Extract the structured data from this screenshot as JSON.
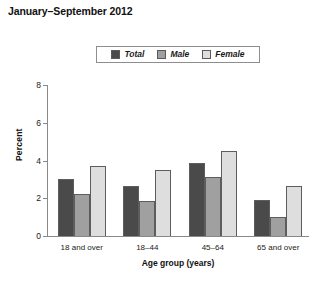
{
  "title": "January–September 2012",
  "legend": {
    "position": "top-center",
    "entries": [
      {
        "label": "Total",
        "color": "#4a4a4a"
      },
      {
        "label": "Male",
        "color": "#a0a0a0"
      },
      {
        "label": "Female",
        "color": "#dedede"
      }
    ]
  },
  "chart_data": {
    "type": "bar",
    "title": "January–September 2012",
    "xlabel": "Age group (years)",
    "ylabel": "Percent",
    "categories": [
      "18 and over",
      "18–44",
      "45–64",
      "65 and over"
    ],
    "series": [
      {
        "name": "Total",
        "color": "#4a4a4a",
        "values": [
          3.0,
          2.65,
          3.85,
          1.9
        ]
      },
      {
        "name": "Male",
        "color": "#a0a0a0",
        "values": [
          2.2,
          1.85,
          3.15,
          1.0
        ]
      },
      {
        "name": "Female",
        "color": "#dedede",
        "values": [
          3.7,
          3.5,
          4.5,
          2.65
        ]
      }
    ],
    "ylim": [
      0,
      8
    ],
    "yticks": [
      0,
      2,
      4,
      6,
      8
    ],
    "ytick_labels": [
      "0",
      "2",
      "4",
      "6",
      "8"
    ],
    "grid": false,
    "legend_position": "top-center"
  }
}
